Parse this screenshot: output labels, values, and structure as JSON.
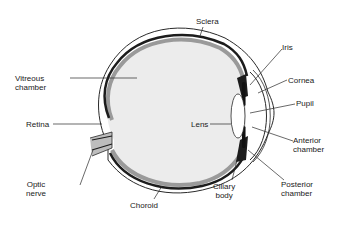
{
  "diagram": {
    "colors": {
      "background": "#ffffff",
      "vitreous_fill": "#ececec",
      "choroid_dark": "#1c1c1c",
      "retina_gray": "#9a9a9a",
      "outline": "#2a2a2a"
    },
    "labels": {
      "sclera": "Sclera",
      "iris": "Iris",
      "cornea": "Cornea",
      "pupil": "Pupil",
      "anterior_chamber": [
        "Anterior",
        "chamber"
      ],
      "posterior_chamber": [
        "Posterior",
        "chamber"
      ],
      "ciliary_body": [
        "Ciliary",
        "body"
      ],
      "choroid": "Choroid",
      "optic_nerve": [
        "Optic",
        "nerve"
      ],
      "retina": "Retina",
      "vitreous_chamber": [
        "Vitreous",
        "chamber"
      ],
      "lens": "Lens"
    }
  }
}
